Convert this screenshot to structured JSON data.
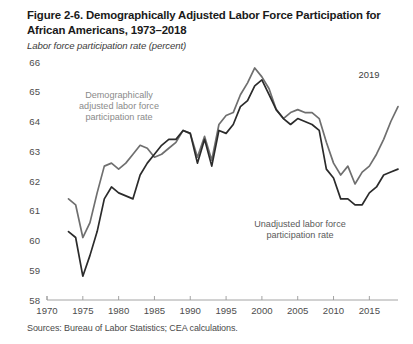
{
  "figure": {
    "title": "Figure 2-6. Demographically Adjusted Labor Force Participation for African Americans, 1973–2018",
    "subtitle": "Labor force participation rate (percent)",
    "source": "Sources: Bureau of Labor Statistics; CEA calculations."
  },
  "annotations": {
    "adjusted_label_line1": "Demographically",
    "adjusted_label_line2": "adjusted labor force",
    "adjusted_label_line3": "participation rate",
    "unadjusted_label_line1": "Unadjusted labor force",
    "unadjusted_label_line2": "participation rate",
    "year_marker": "2019"
  },
  "colors": {
    "adjusted_line": "#6f6f6f",
    "unadjusted_line": "#2b2b2b",
    "axis": "#9a9a9a",
    "tick_text": "#4d4d4d",
    "annotation_gray": "#8a8a8a"
  },
  "chart_data": {
    "type": "line",
    "title": "Figure 2-6. Demographically Adjusted Labor Force Participation for African Americans, 1973–2018",
    "xlabel": "",
    "ylabel": "Labor force participation rate (percent)",
    "xlim": [
      1970,
      2019
    ],
    "ylim": [
      58,
      66
    ],
    "yticks": [
      58,
      59,
      60,
      61,
      62,
      63,
      64,
      65,
      66
    ],
    "xticks": [
      1970,
      1975,
      1980,
      1985,
      1990,
      1995,
      2000,
      2005,
      2010,
      2015
    ],
    "grid": false,
    "legend": "annotations-inline",
    "x": [
      1973,
      1974,
      1975,
      1976,
      1977,
      1978,
      1979,
      1980,
      1981,
      1982,
      1983,
      1984,
      1985,
      1986,
      1987,
      1988,
      1989,
      1990,
      1991,
      1992,
      1993,
      1994,
      1995,
      1996,
      1997,
      1998,
      1999,
      2000,
      2001,
      2002,
      2003,
      2004,
      2005,
      2006,
      2007,
      2008,
      2009,
      2010,
      2011,
      2012,
      2013,
      2014,
      2015,
      2016,
      2017,
      2018,
      2019
    ],
    "series": [
      {
        "name": "Demographically adjusted labor force participation rate",
        "color": "#6f6f6f",
        "values": [
          61.4,
          61.2,
          60.1,
          60.6,
          61.6,
          62.5,
          62.6,
          62.4,
          62.6,
          62.9,
          63.2,
          63.1,
          62.8,
          62.9,
          63.1,
          63.3,
          63.7,
          63.6,
          62.8,
          63.5,
          62.7,
          63.9,
          64.2,
          64.3,
          64.9,
          65.3,
          65.8,
          65.5,
          65.1,
          64.4,
          64.1,
          64.3,
          64.4,
          64.3,
          64.3,
          64.1,
          63.3,
          62.6,
          62.2,
          62.5,
          61.9,
          62.3,
          62.5,
          62.9,
          63.4,
          64.0,
          64.5
        ]
      },
      {
        "name": "Unadjusted labor force participation rate",
        "color": "#2b2b2b",
        "values": [
          60.3,
          60.1,
          58.8,
          59.5,
          60.3,
          61.4,
          61.8,
          61.6,
          61.5,
          61.4,
          62.2,
          62.6,
          62.9,
          63.2,
          63.4,
          63.4,
          63.7,
          63.6,
          62.6,
          63.4,
          62.5,
          63.7,
          63.6,
          63.9,
          64.5,
          64.7,
          65.2,
          65.4,
          64.9,
          64.4,
          64.1,
          63.9,
          64.1,
          64.0,
          63.9,
          63.7,
          62.4,
          62.1,
          61.4,
          61.4,
          61.2,
          61.2,
          61.6,
          61.8,
          62.2,
          62.3,
          62.4
        ]
      }
    ]
  },
  "geometry": {
    "plot_left": 47,
    "plot_right": 398,
    "plot_top": 10,
    "plot_bottom": 248,
    "x_min": 1970,
    "x_max": 2019,
    "y_min": 58,
    "y_max": 66
  }
}
